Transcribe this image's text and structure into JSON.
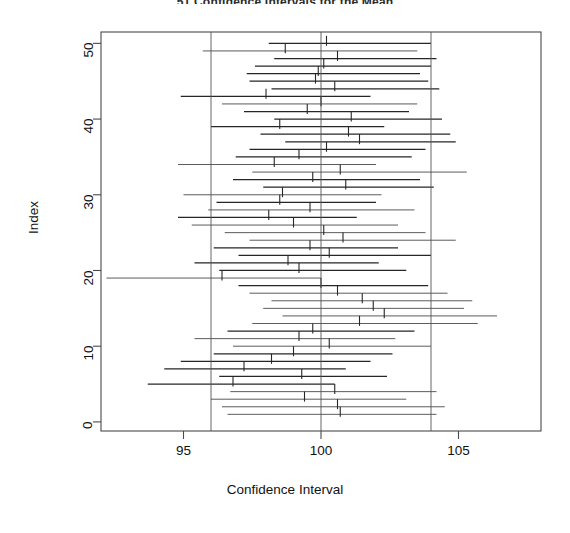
{
  "chart_data": {
    "type": "line",
    "title": "51 Confidence Intervals for the Mean",
    "xlabel": "Confidence Interval",
    "ylabel": "Index",
    "xlim": [
      92.0,
      108.0
    ],
    "ylim": [
      -1.2,
      51.5
    ],
    "xticks": [
      95,
      100,
      105
    ],
    "yticks": [
      0,
      10,
      20,
      30,
      40,
      50
    ],
    "xticklabels": [
      "95",
      "100",
      "105"
    ],
    "yticklabels": [
      "0",
      "10",
      "20",
      "30",
      "40",
      "50"
    ],
    "grid": false,
    "legend": null,
    "reference_lines": {
      "color": "#555555",
      "orientation": "vertical",
      "values": [
        96.0,
        100.0,
        104.0
      ]
    },
    "series_description": "Horizontal confidence interval segments with a vertical tick at the point estimate, one per index.",
    "intervals": [
      {
        "index": 50,
        "lower": 98.1,
        "estimate": 100.2,
        "upper": 104.0
      },
      {
        "index": 49,
        "lower": 95.7,
        "estimate": 98.7,
        "upper": 103.5
      },
      {
        "index": 48,
        "lower": 98.3,
        "estimate": 100.6,
        "upper": 104.2
      },
      {
        "index": 47,
        "lower": 97.6,
        "estimate": 100.1,
        "upper": 104.0
      },
      {
        "index": 46,
        "lower": 97.3,
        "estimate": 99.9,
        "upper": 103.6
      },
      {
        "index": 45,
        "lower": 97.4,
        "estimate": 99.8,
        "upper": 103.9
      },
      {
        "index": 44,
        "lower": 98.2,
        "estimate": 100.5,
        "upper": 104.3
      },
      {
        "index": 43,
        "lower": 94.9,
        "estimate": 98.0,
        "upper": 101.8
      },
      {
        "index": 42,
        "lower": 96.4,
        "estimate": 100.0,
        "upper": 103.5
      },
      {
        "index": 41,
        "lower": 97.2,
        "estimate": 99.5,
        "upper": 103.2
      },
      {
        "index": 40,
        "lower": 98.3,
        "estimate": 101.1,
        "upper": 104.4
      },
      {
        "index": 39,
        "lower": 96.0,
        "estimate": 98.5,
        "upper": 102.3
      },
      {
        "index": 38,
        "lower": 97.8,
        "estimate": 101.0,
        "upper": 104.7
      },
      {
        "index": 37,
        "lower": 98.7,
        "estimate": 101.4,
        "upper": 104.9
      },
      {
        "index": 36,
        "lower": 97.4,
        "estimate": 100.2,
        "upper": 103.8
      },
      {
        "index": 35,
        "lower": 96.9,
        "estimate": 99.2,
        "upper": 103.3
      },
      {
        "index": 34,
        "lower": 94.8,
        "estimate": 98.3,
        "upper": 102.0
      },
      {
        "index": 33,
        "lower": 97.5,
        "estimate": 100.7,
        "upper": 105.3
      },
      {
        "index": 32,
        "lower": 96.8,
        "estimate": 99.7,
        "upper": 103.6
      },
      {
        "index": 31,
        "lower": 97.9,
        "estimate": 100.9,
        "upper": 104.1
      },
      {
        "index": 30,
        "lower": 95.0,
        "estimate": 98.6,
        "upper": 102.2
      },
      {
        "index": 29,
        "lower": 96.2,
        "estimate": 98.5,
        "upper": 102.0
      },
      {
        "index": 28,
        "lower": 95.9,
        "estimate": 99.6,
        "upper": 103.4
      },
      {
        "index": 27,
        "lower": 94.8,
        "estimate": 98.1,
        "upper": 101.3
      },
      {
        "index": 26,
        "lower": 95.3,
        "estimate": 99.0,
        "upper": 102.8
      },
      {
        "index": 25,
        "lower": 96.5,
        "estimate": 100.1,
        "upper": 103.8
      },
      {
        "index": 24,
        "lower": 97.4,
        "estimate": 100.8,
        "upper": 104.9
      },
      {
        "index": 23,
        "lower": 96.1,
        "estimate": 99.6,
        "upper": 102.8
      },
      {
        "index": 22,
        "lower": 97.0,
        "estimate": 100.3,
        "upper": 104.0
      },
      {
        "index": 21,
        "lower": 95.4,
        "estimate": 98.8,
        "upper": 102.1
      },
      {
        "index": 20,
        "lower": 96.3,
        "estimate": 99.2,
        "upper": 103.1
      },
      {
        "index": 19,
        "lower": 92.2,
        "estimate": 96.4,
        "upper": 100.0
      },
      {
        "index": 18,
        "lower": 97.0,
        "estimate": 100.0,
        "upper": 103.9
      },
      {
        "index": 17,
        "lower": 97.4,
        "estimate": 100.6,
        "upper": 104.6
      },
      {
        "index": 16,
        "lower": 98.2,
        "estimate": 101.5,
        "upper": 105.5
      },
      {
        "index": 15,
        "lower": 97.9,
        "estimate": 101.9,
        "upper": 105.2
      },
      {
        "index": 14,
        "lower": 98.6,
        "estimate": 102.3,
        "upper": 106.4
      },
      {
        "index": 13,
        "lower": 97.5,
        "estimate": 101.4,
        "upper": 105.7
      },
      {
        "index": 12,
        "lower": 96.6,
        "estimate": 99.7,
        "upper": 103.4
      },
      {
        "index": 11,
        "lower": 95.4,
        "estimate": 99.2,
        "upper": 102.7
      },
      {
        "index": 10,
        "lower": 96.8,
        "estimate": 100.3,
        "upper": 104.0
      },
      {
        "index": 9,
        "lower": 96.1,
        "estimate": 99.0,
        "upper": 102.6
      },
      {
        "index": 8,
        "lower": 94.9,
        "estimate": 98.2,
        "upper": 101.8
      },
      {
        "index": 7,
        "lower": 94.3,
        "estimate": 97.2,
        "upper": 100.9
      },
      {
        "index": 6,
        "lower": 96.3,
        "estimate": 99.3,
        "upper": 102.4
      },
      {
        "index": 5,
        "lower": 93.7,
        "estimate": 96.8,
        "upper": 100.5
      },
      {
        "index": 4,
        "lower": 96.7,
        "estimate": 100.5,
        "upper": 104.2
      },
      {
        "index": 3,
        "lower": 96.0,
        "estimate": 99.4,
        "upper": 103.1
      },
      {
        "index": 2,
        "lower": 96.4,
        "estimate": 100.6,
        "upper": 104.5
      },
      {
        "index": 1,
        "lower": 96.6,
        "estimate": 100.7,
        "upper": 104.2
      }
    ],
    "style": {
      "line_color": "#262626",
      "reference_line_color": "#555555",
      "background": "#ffffff",
      "box_color": "#4a4a4a"
    }
  }
}
